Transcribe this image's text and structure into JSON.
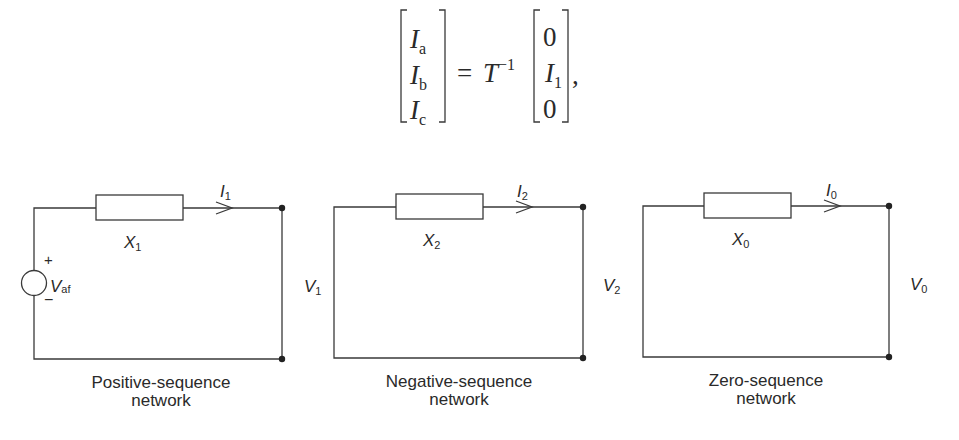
{
  "equation": {
    "lhs": [
      {
        "sym": "I",
        "sub": "a"
      },
      {
        "sym": "I",
        "sub": "b"
      },
      {
        "sym": "I",
        "sub": "c"
      }
    ],
    "equals": "=",
    "operator": "T",
    "operator_sup": "−1",
    "rhs": [
      {
        "sym": "0",
        "sub": ""
      },
      {
        "sym": "I",
        "sub": "1"
      },
      {
        "sym": "0",
        "sub": ""
      }
    ],
    "trailing": ","
  },
  "networks": [
    {
      "title_line1": "Positive-sequence",
      "title_line2": "network",
      "reactance": {
        "sym": "X",
        "sub": "1"
      },
      "current": {
        "sym": "I",
        "sub": "1"
      },
      "voltage": {
        "sym": "V",
        "sub": "1"
      },
      "source": {
        "sym": "V",
        "sub": "af",
        "plus": "+",
        "minus": "−"
      }
    },
    {
      "title_line1": "Negative-sequence",
      "title_line2": "network",
      "reactance": {
        "sym": "X",
        "sub": "2"
      },
      "current": {
        "sym": "I",
        "sub": "2"
      },
      "voltage": {
        "sym": "V",
        "sub": "2"
      }
    },
    {
      "title_line1": "Zero-sequence",
      "title_line2": "network",
      "reactance": {
        "sym": "X",
        "sub": "0"
      },
      "current": {
        "sym": "I",
        "sub": "0"
      },
      "voltage": {
        "sym": "V",
        "sub": "0"
      }
    }
  ]
}
